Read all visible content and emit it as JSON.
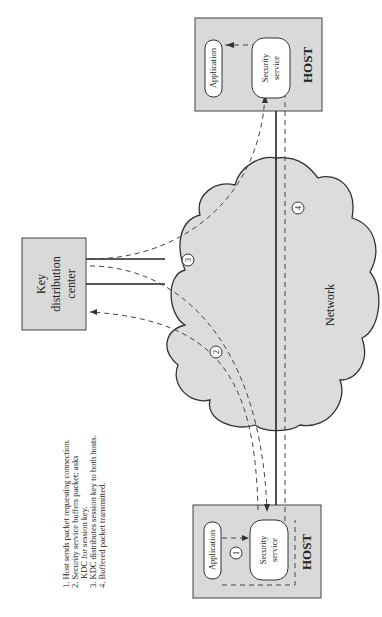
{
  "diagram": {
    "orientation": "rotated-90-ccw",
    "kdc": {
      "line1": "Key",
      "line2": "distribution",
      "line3": "center"
    },
    "network": {
      "label": "Network"
    },
    "host_bottom": {
      "label": "HOST",
      "application": "Application",
      "security_line1": "Security",
      "security_line2": "service",
      "step": "1"
    },
    "host_top": {
      "label": "HOST",
      "application": "Application",
      "security_line1": "Security",
      "security_line2": "service"
    },
    "steps": {
      "s2": "2",
      "s3": "3",
      "s4": "4"
    },
    "legend": [
      "1. Host sends packet requesting connection.",
      "2. Security service buffers packet; asks",
      "KDC for session key.",
      "3. KDC distributes session key to both hosts.",
      "4. Buffered packet transmitted."
    ],
    "colors": {
      "box_fill": "#d9d9d9",
      "cloud_fill": "#dcdcdc",
      "stroke": "#333333"
    }
  }
}
